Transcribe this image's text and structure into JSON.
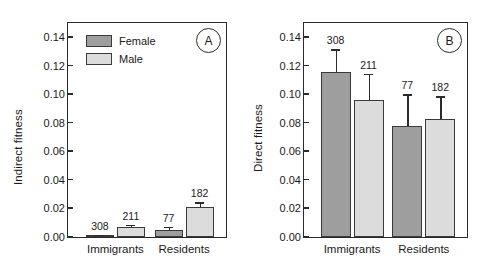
{
  "figure": {
    "width": 488,
    "height": 274,
    "background": "#ffffff"
  },
  "colors": {
    "female": "#9e9e9e",
    "male": "#dcdcdc",
    "axis": "#2b2b2b",
    "text": "#1a1a1a",
    "bar_outline": "#3a3a3a"
  },
  "legend": {
    "position": "top-left-inside-panel-a",
    "entries": [
      {
        "label": "Female",
        "color": "#9e9e9e"
      },
      {
        "label": "Male",
        "color": "#dcdcdc"
      }
    ]
  },
  "panels": [
    {
      "letter": "A",
      "ylabel": "Indirect fitness"
    },
    {
      "letter": "B",
      "ylabel": "Direct fitness"
    }
  ],
  "axis": {
    "ticks": [
      "0.14",
      "0.12",
      "0.10",
      "0.08",
      "0.06",
      "0.04",
      "0.02",
      "0.00"
    ],
    "tick_values": [
      0.14,
      0.12,
      0.1,
      0.08,
      0.06,
      0.04,
      0.02,
      0.0
    ],
    "ymin": 0.0,
    "ymax": 0.15
  },
  "xlabels": [
    "Immigrants",
    "Residents"
  ],
  "chart_data": [
    {
      "type": "bar",
      "title": "A",
      "xlabel": "",
      "ylabel": "Indirect fitness",
      "ylim": [
        0.0,
        0.15
      ],
      "yticks": [
        0.0,
        0.02,
        0.04,
        0.06,
        0.08,
        0.1,
        0.12,
        0.14
      ],
      "grid": false,
      "legend": "inside top-left",
      "categories": [
        "Immigrants",
        "Residents"
      ],
      "series": [
        {
          "name": "Female",
          "color": "#9e9e9e",
          "values": [
            0.0005,
            0.005
          ],
          "errors": [
            0.0004,
            0.0022
          ],
          "sample_sizes": [
            308,
            77
          ]
        },
        {
          "name": "Male",
          "color": "#dcdcdc",
          "values": [
            0.007,
            0.021
          ],
          "errors": [
            0.0013,
            0.0032
          ],
          "sample_sizes": [
            211,
            182
          ]
        }
      ],
      "annotations": [
        "308",
        "211",
        "77",
        "182"
      ]
    },
    {
      "type": "bar",
      "title": "B",
      "xlabel": "",
      "ylabel": "Direct fitness",
      "ylim": [
        0.0,
        0.15
      ],
      "yticks": [
        0.0,
        0.02,
        0.04,
        0.06,
        0.08,
        0.1,
        0.12,
        0.14
      ],
      "grid": false,
      "legend": "none",
      "categories": [
        "Immigrants",
        "Residents"
      ],
      "series": [
        {
          "name": "Female",
          "color": "#9e9e9e",
          "values": [
            0.116,
            0.0775
          ],
          "errors": [
            0.0155,
            0.0225
          ],
          "sample_sizes": [
            308,
            77
          ]
        },
        {
          "name": "Male",
          "color": "#dcdcdc",
          "values": [
            0.096,
            0.083
          ],
          "errors": [
            0.0185,
            0.0155
          ],
          "sample_sizes": [
            211,
            182
          ]
        }
      ],
      "annotations": [
        "308",
        "211",
        "77",
        "182"
      ]
    }
  ]
}
